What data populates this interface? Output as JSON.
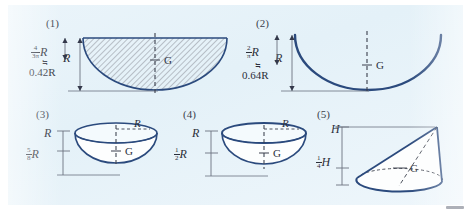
{
  "page": {
    "background_color": "#ffffff",
    "panel_color": "#e8f3fa",
    "ink_color": "#2b4a7d",
    "text_color": "#2b2f3a"
  },
  "figures": [
    {
      "caption": "(1)",
      "shape": "semicircular-area-hatched",
      "centroid_label": "G",
      "dim_labels": {
        "height": "R",
        "centroid_numerator": "4",
        "centroid_denominator": "3π",
        "centroid_symbol": "R",
        "approx_sign": "≒",
        "approx_value": "0.42R"
      }
    },
    {
      "caption": "(2)",
      "shape": "semicircular-arc-wire",
      "centroid_label": "G",
      "dim_labels": {
        "height": "R",
        "centroid_numerator": "2",
        "centroid_denominator": "π",
        "centroid_symbol": "R",
        "approx_sign": "≒",
        "approx_value": "0.64R"
      }
    },
    {
      "caption": "(3)",
      "shape": "solid-hemisphere",
      "centroid_label": "G",
      "dim_labels": {
        "radius_top": "R",
        "radius_rim": "R",
        "centroid_numerator": "5",
        "centroid_denominator": "8",
        "centroid_symbol": "R"
      }
    },
    {
      "caption": "(4)",
      "shape": "hemispherical-shell",
      "centroid_label": "G",
      "dim_labels": {
        "radius_top": "R",
        "radius_rim": "R",
        "centroid_numerator": "1",
        "centroid_denominator": "2",
        "centroid_symbol": "R"
      }
    },
    {
      "caption": "(5)",
      "shape": "cone",
      "centroid_label": "G",
      "dim_labels": {
        "height_top": "H",
        "centroid_numerator": "1",
        "centroid_denominator": "4",
        "centroid_symbol": "H"
      }
    }
  ]
}
